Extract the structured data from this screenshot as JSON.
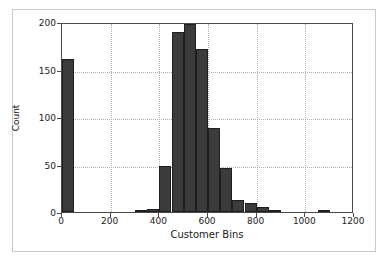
{
  "chart_data": {
    "type": "bar",
    "title": "",
    "xlabel": "Customer Bins",
    "ylabel": "Count",
    "xlim": [
      0,
      1200
    ],
    "ylim": [
      0,
      200
    ],
    "xticks": [
      0,
      200,
      400,
      600,
      800,
      1000,
      1200
    ],
    "xtick_labels": [
      "0",
      "200",
      "400",
      "600",
      "800",
      "1000",
      "1200"
    ],
    "yticks": [
      0,
      50,
      100,
      150,
      200
    ],
    "ytick_labels": [
      "0",
      "50",
      "100",
      "150",
      "200"
    ],
    "grid": true,
    "bin_width": 50,
    "bar_color": "#3b3b3b",
    "bar_edge_color": "#1e1e1e",
    "bins": [
      {
        "start": 0,
        "end": 50,
        "value": 161
      },
      {
        "start": 300,
        "end": 350,
        "value": 1
      },
      {
        "start": 350,
        "end": 400,
        "value": 3
      },
      {
        "start": 400,
        "end": 450,
        "value": 48
      },
      {
        "start": 450,
        "end": 500,
        "value": 190
      },
      {
        "start": 500,
        "end": 550,
        "value": 198
      },
      {
        "start": 550,
        "end": 600,
        "value": 172
      },
      {
        "start": 600,
        "end": 650,
        "value": 88
      },
      {
        "start": 650,
        "end": 700,
        "value": 46
      },
      {
        "start": 700,
        "end": 750,
        "value": 13
      },
      {
        "start": 750,
        "end": 800,
        "value": 10
      },
      {
        "start": 800,
        "end": 850,
        "value": 5
      },
      {
        "start": 850,
        "end": 900,
        "value": 1
      },
      {
        "start": 1050,
        "end": 1100,
        "value": 2
      }
    ]
  }
}
